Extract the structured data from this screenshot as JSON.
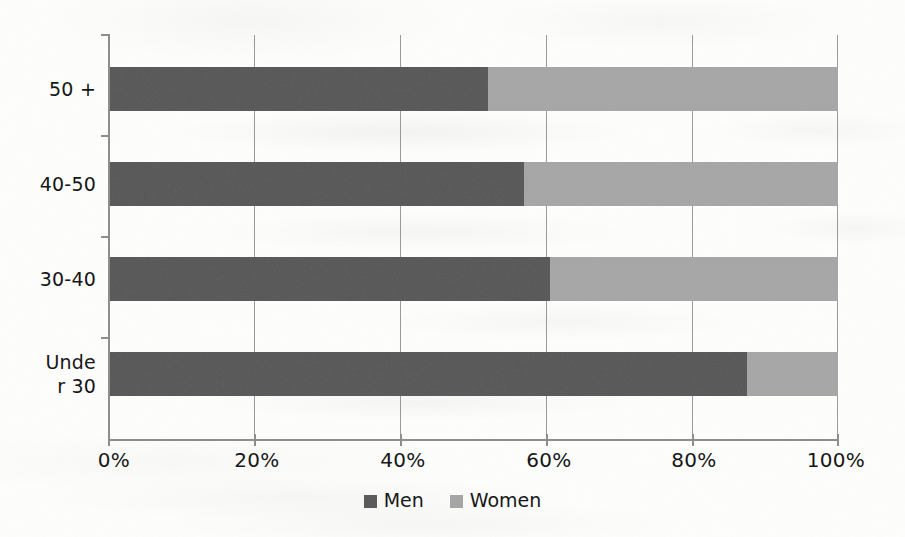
{
  "chart_data": {
    "type": "bar",
    "orientation": "horizontal",
    "stacked": true,
    "normalized": true,
    "title": "",
    "subtitle": "",
    "xlabel": "",
    "ylabel": "",
    "categories": [
      "Under 30",
      "30-40",
      "40-50",
      "50 +"
    ],
    "category_labels_display": [
      "Unde\nr 30",
      "30-40",
      "40-50",
      "50 +"
    ],
    "series": [
      {
        "name": "Men",
        "color": "#595959",
        "values": [
          87.5,
          60.5,
          57.0,
          52.0
        ]
      },
      {
        "name": "Women",
        "color": "#a6a6a6",
        "values": [
          12.5,
          39.5,
          43.0,
          48.0
        ]
      }
    ],
    "xlim": [
      0,
      100
    ],
    "xticks": [
      0,
      20,
      40,
      60,
      80,
      100
    ],
    "xtick_labels": [
      "0%",
      "20%",
      "40%",
      "60%",
      "80%",
      "100%"
    ],
    "grid": {
      "vertical": true,
      "horizontal": false
    },
    "legend": {
      "position": "bottom",
      "entries": [
        "Men",
        "Women"
      ]
    }
  },
  "axis": {
    "tick_labels": [
      "0%",
      "20%",
      "40%",
      "60%",
      "80%",
      "100%"
    ],
    "category_top_to_bottom": [
      "50 +",
      "40-50",
      "30-40",
      "Unde",
      "r 30"
    ]
  },
  "rows": [
    {
      "label_line1": "50 +",
      "label_line2": "",
      "men": 52.0,
      "women": 48.0
    },
    {
      "label_line1": "40-50",
      "label_line2": "",
      "men": 57.0,
      "women": 43.0
    },
    {
      "label_line1": "30-40",
      "label_line2": "",
      "men": 60.5,
      "women": 39.5
    },
    {
      "label_line1": "Unde",
      "label_line2": "r 30",
      "men": 87.5,
      "women": 12.5
    }
  ],
  "legend": {
    "men_label": "Men",
    "women_label": "Women"
  },
  "colors": {
    "men": "#595959",
    "women": "#a6a6a6",
    "axis": "#8d8d8d",
    "grid": "#9a9a9a",
    "text": "#141414",
    "background": "#fdfdfc"
  }
}
